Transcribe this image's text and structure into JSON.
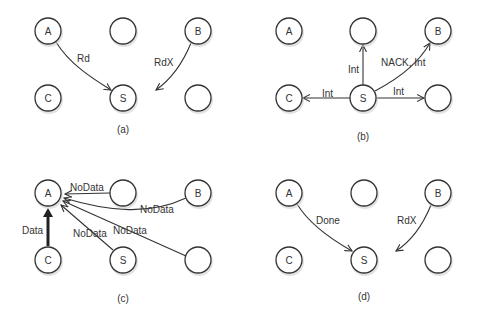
{
  "panels": [
    {
      "id": "a",
      "caption": "(a)",
      "nodes": [
        {
          "id": "A",
          "label": "A"
        },
        {
          "id": "top-mid",
          "label": ""
        },
        {
          "id": "B",
          "label": "B"
        },
        {
          "id": "C",
          "label": "C"
        },
        {
          "id": "S",
          "label": "S"
        },
        {
          "id": "bottom-right",
          "label": ""
        }
      ],
      "edges": [
        {
          "from": "A",
          "to": "S",
          "label": "Rd"
        },
        {
          "from": "B",
          "to": "S",
          "label": "RdX"
        }
      ]
    },
    {
      "id": "b",
      "caption": "(b)",
      "nodes": [
        {
          "id": "A",
          "label": "A"
        },
        {
          "id": "top-mid",
          "label": ""
        },
        {
          "id": "B",
          "label": "B"
        },
        {
          "id": "C",
          "label": "C"
        },
        {
          "id": "S",
          "label": "S"
        },
        {
          "id": "bottom-right",
          "label": ""
        }
      ],
      "edges": [
        {
          "from": "S",
          "to": "top-mid",
          "label": "Int"
        },
        {
          "from": "S",
          "to": "B",
          "label": "NACK, Int"
        },
        {
          "from": "S",
          "to": "C",
          "label": "Int"
        },
        {
          "from": "S",
          "to": "bottom-right",
          "label": "Int"
        }
      ]
    },
    {
      "id": "c",
      "caption": "(c)",
      "nodes": [
        {
          "id": "A",
          "label": "A"
        },
        {
          "id": "top-mid",
          "label": ""
        },
        {
          "id": "B",
          "label": "B"
        },
        {
          "id": "C",
          "label": "C"
        },
        {
          "id": "S",
          "label": "S"
        },
        {
          "id": "bottom-right",
          "label": ""
        }
      ],
      "edges": [
        {
          "from": "top-mid",
          "to": "A",
          "label": "NoData"
        },
        {
          "from": "B",
          "to": "A",
          "label": "NoData"
        },
        {
          "from": "C",
          "to": "A",
          "label": "Data"
        },
        {
          "from": "S",
          "to": "A",
          "label": "NoData"
        },
        {
          "from": "bottom-right",
          "to": "A",
          "label": "NoData"
        }
      ]
    },
    {
      "id": "d",
      "caption": "(d)",
      "nodes": [
        {
          "id": "A",
          "label": "A"
        },
        {
          "id": "top-mid",
          "label": ""
        },
        {
          "id": "B",
          "label": "B"
        },
        {
          "id": "C",
          "label": "C"
        },
        {
          "id": "S",
          "label": "S"
        },
        {
          "id": "bottom-right",
          "label": ""
        }
      ],
      "edges": [
        {
          "from": "A",
          "to": "S",
          "label": "Done"
        },
        {
          "from": "B",
          "to": "S",
          "label": "RdX"
        }
      ]
    }
  ]
}
